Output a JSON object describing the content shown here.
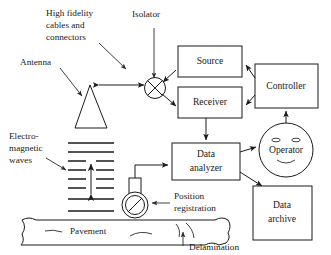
{
  "diagram": {
    "colors": {
      "stroke": "#1a1a1a",
      "background": "#ffffff",
      "leader": "#2a2a2a"
    },
    "boxes": [
      {
        "id": "source",
        "label": "Source"
      },
      {
        "id": "receiver",
        "label": "Receiver"
      },
      {
        "id": "controller",
        "label": "Controller"
      },
      {
        "id": "data_analyzer",
        "label_line1": "Data",
        "label_line2": "analyzer"
      },
      {
        "id": "data_archive",
        "label_line1": "Data",
        "label_line2": "archive"
      }
    ],
    "nodes": [
      {
        "id": "operator",
        "label": "Operator",
        "shape": "smiley-face-circle"
      },
      {
        "id": "isolator_symbol",
        "label": "",
        "shape": "circle-with-x"
      },
      {
        "id": "antenna_symbol",
        "label": "",
        "shape": "triangle"
      },
      {
        "id": "wheel_symbol",
        "label": "",
        "shape": "circle-with-slash"
      },
      {
        "id": "pavement_slab",
        "label": "Pavement",
        "shape": "slab"
      }
    ],
    "annotations": [
      {
        "id": "high_fidelity",
        "line1": "High fidelity",
        "line2": "cables and",
        "line3": "connectors"
      },
      {
        "id": "isolator",
        "text": "Isolator"
      },
      {
        "id": "antenna",
        "text": "Antenna"
      },
      {
        "id": "em_waves",
        "line1": "Electro-",
        "line2": "magnetic",
        "line3": "waves"
      },
      {
        "id": "position_registration",
        "line1": "Position",
        "line2": "registration"
      },
      {
        "id": "delamination",
        "text": "Delamination"
      },
      {
        "id": "pavement",
        "text": "Pavement"
      }
    ]
  }
}
